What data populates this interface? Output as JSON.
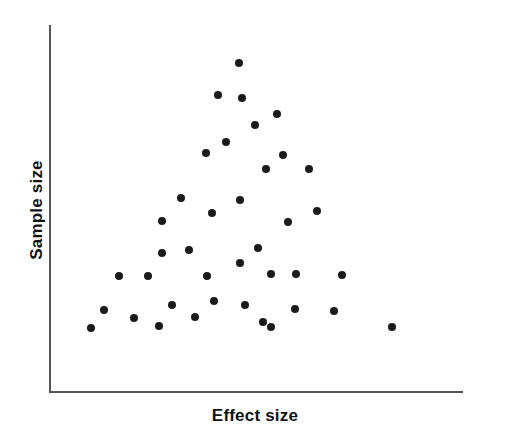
{
  "chart_data": {
    "type": "scatter",
    "title": "",
    "subtitle": "",
    "xlabel": "Effect size",
    "ylabel": "Sample size",
    "xlim": [
      0,
      1
    ],
    "ylim": [
      0,
      1
    ],
    "grid": false,
    "legend": null,
    "annotations": [],
    "axis_ticks": {
      "x": [],
      "y": []
    },
    "marker": {
      "shape": "circle",
      "size_px": 8,
      "color": "#1b1b1b"
    },
    "axis_color": "#555555",
    "background_color": "#ffffff",
    "series": [
      {
        "name": "studies",
        "points_px": [
          [
            239,
            63
          ],
          [
            218,
            95
          ],
          [
            242,
            98
          ],
          [
            277,
            114
          ],
          [
            255,
            125
          ],
          [
            226,
            142
          ],
          [
            206,
            153
          ],
          [
            283,
            155
          ],
          [
            266,
            169
          ],
          [
            309,
            169
          ],
          [
            181,
            198
          ],
          [
            240,
            200
          ],
          [
            317,
            211
          ],
          [
            212,
            213
          ],
          [
            162,
            221
          ],
          [
            288,
            222
          ],
          [
            162,
            253
          ],
          [
            189,
            250
          ],
          [
            258,
            248
          ],
          [
            240,
            263
          ],
          [
            271,
            274
          ],
          [
            296,
            274
          ],
          [
            119,
            276
          ],
          [
            148,
            276
          ],
          [
            207,
            276
          ],
          [
            342,
            275
          ],
          [
            214,
            301
          ],
          [
            104,
            310
          ],
          [
            245,
            305
          ],
          [
            295,
            309
          ],
          [
            334,
            311
          ],
          [
            172,
            305
          ],
          [
            134,
            318
          ],
          [
            195,
            317
          ],
          [
            263,
            322
          ],
          [
            271,
            327
          ],
          [
            159,
            326
          ],
          [
            91,
            328
          ],
          [
            392,
            327
          ]
        ],
        "count": 39
      }
    ]
  }
}
